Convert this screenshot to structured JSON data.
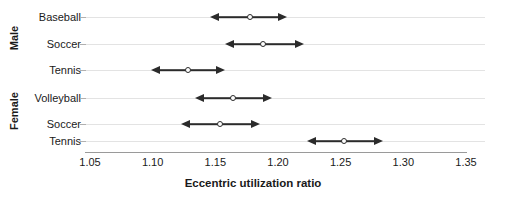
{
  "chart_data": {
    "type": "scatter",
    "title": "",
    "subtitle": "",
    "xlabel": "Eccentric utilization ratio",
    "ylabel": "",
    "xlim": [
      1.05,
      1.35
    ],
    "xticks": [
      "1.05",
      "1.10",
      "1.15",
      "1.20",
      "1.25",
      "1.30",
      "1.35"
    ],
    "xtick_values": [
      1.05,
      1.1,
      1.15,
      1.2,
      1.25,
      1.3,
      1.35
    ],
    "grid": true,
    "legend_position": "none",
    "group_axis_label_male": "Male",
    "group_axis_label_female": "Female",
    "marker_style": "open-circle",
    "error_style": "double-headed-arrow",
    "series_color": "#2b2b2b",
    "grid_color": "#e3e3e3",
    "groups": [
      {
        "group": "Male",
        "rows": [
          {
            "category": "Baseball",
            "value": 1.178,
            "low": 1.146,
            "high": 1.207
          },
          {
            "category": "Soccer",
            "value": 1.188,
            "low": 1.158,
            "high": 1.221
          },
          {
            "category": "Tennis",
            "value": 1.128,
            "low": 1.099,
            "high": 1.158
          }
        ]
      },
      {
        "group": "Female",
        "rows": [
          {
            "category": "Volleyball",
            "value": 1.164,
            "low": 1.134,
            "high": 1.195
          },
          {
            "category": "Soccer",
            "value": 1.154,
            "low": 1.123,
            "high": 1.186
          },
          {
            "category": "Tennis",
            "value": 1.253,
            "low": 1.223,
            "high": 1.284
          }
        ]
      }
    ]
  }
}
